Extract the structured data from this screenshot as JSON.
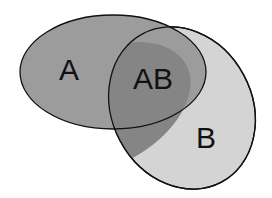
{
  "diagram": {
    "type": "venn",
    "sets": [
      {
        "id": "A",
        "label": "A",
        "color": "#9a9a9a"
      },
      {
        "id": "B",
        "label": "B",
        "color": "#d6d6d6"
      }
    ],
    "intersection": {
      "label": "AB",
      "color": "#858585"
    },
    "outline_color": "#111111"
  }
}
